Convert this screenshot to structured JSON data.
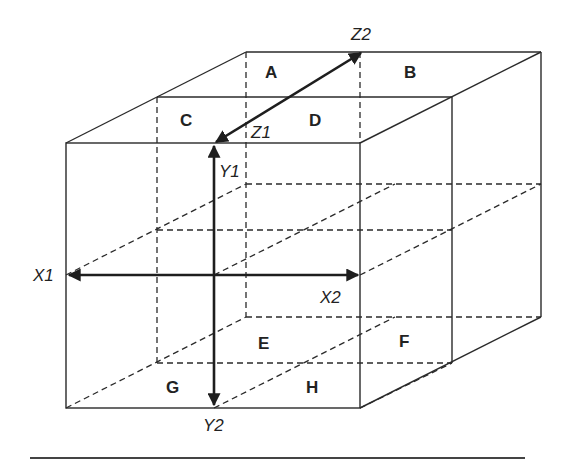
{
  "diagram": {
    "regions": {
      "A": "A",
      "B": "B",
      "C": "C",
      "D": "D",
      "E": "E",
      "F": "F",
      "G": "G",
      "H": "H"
    },
    "axes": {
      "x1": "X1",
      "x2": "X2",
      "y1": "Y1",
      "y2": "Y2",
      "z1": "Z1",
      "z2": "Z2"
    },
    "colors": {
      "line": "#2a2a2a",
      "background": "#ffffff"
    }
  }
}
